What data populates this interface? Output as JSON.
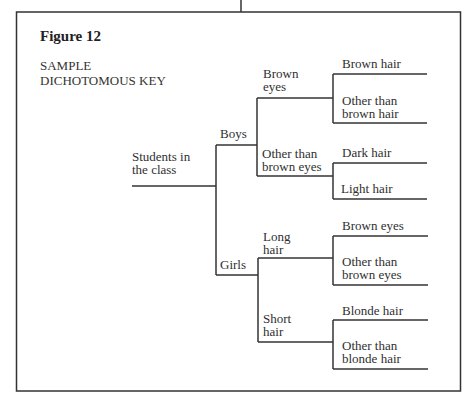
{
  "figure": {
    "title": "Figure 12",
    "subtitle_lines": [
      "SAMPLE",
      "DICHOTOMOUS KEY"
    ]
  },
  "tree": {
    "root": {
      "label_lines": [
        "Students in",
        "the class"
      ]
    },
    "level1": [
      {
        "id": "boys",
        "label": "Boys",
        "level2": [
          {
            "id": "brown-eyes",
            "label_lines": [
              "Brown",
              "eyes"
            ],
            "leaves": [
              {
                "label_lines": [
                  "Brown hair"
                ]
              },
              {
                "label_lines": [
                  "Other than",
                  "brown hair"
                ]
              }
            ]
          },
          {
            "id": "other-than-brown-eyes",
            "label_lines": [
              "Other than",
              "brown eyes"
            ],
            "leaves": [
              {
                "label_lines": [
                  "Dark hair"
                ]
              },
              {
                "label_lines": [
                  "Light hair"
                ]
              }
            ]
          }
        ]
      },
      {
        "id": "girls",
        "label": "Girls",
        "level2": [
          {
            "id": "long-hair",
            "label_lines": [
              "Long",
              "hair"
            ],
            "leaves": [
              {
                "label_lines": [
                  "Brown eyes"
                ]
              },
              {
                "label_lines": [
                  "Other than",
                  "brown eyes"
                ]
              }
            ]
          },
          {
            "id": "short-hair",
            "label_lines": [
              "Short",
              "hair"
            ],
            "leaves": [
              {
                "label_lines": [
                  "Blonde hair"
                ]
              },
              {
                "label_lines": [
                  "Other than",
                  "blonde hair"
                ]
              }
            ]
          }
        ]
      }
    ]
  },
  "colors": {
    "line": "#333333",
    "text": "#2f2f2f",
    "background": "#ffffff"
  }
}
